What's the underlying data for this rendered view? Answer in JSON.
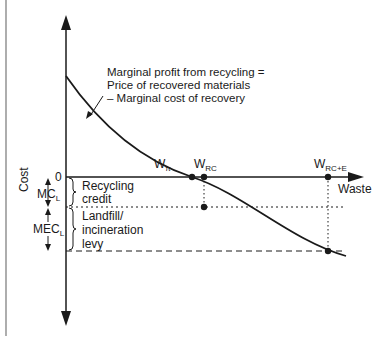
{
  "diagram": {
    "axes": {
      "y_label": "Cost",
      "x_label": "Waste",
      "zero_label": "0"
    },
    "curve_annotation": {
      "line1": "Marginal profit from recycling =",
      "line2": "Price of recovered materials",
      "line3": "– Marginal cost of recovery"
    },
    "points": {
      "w_pi": {
        "base": "W",
        "sub": "π"
      },
      "w_rc": {
        "base": "W",
        "sub": "RC"
      },
      "w_rce": {
        "base": "W",
        "sub": "RC+E"
      }
    },
    "brackets": {
      "recycling_credit": {
        "line1": "Recycling",
        "line2": "credit"
      },
      "levy": {
        "line1": "Landfill/",
        "line2": "incineration",
        "line3": "levy"
      }
    },
    "measures": {
      "mc_l": {
        "base": "MC",
        "sub": "L"
      },
      "mec_l": {
        "base": "MEC",
        "sub": "L"
      }
    }
  }
}
